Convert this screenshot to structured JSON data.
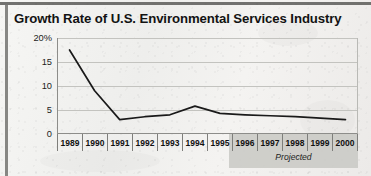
{
  "title": "Growth Rate of U.S. Environmental Services Industry",
  "annotation": "Projected",
  "colors": {
    "line": "#1a1a1a",
    "grid": "#c3c3bf",
    "axis": "#8d8d8a",
    "projected_band": "#c9c9c5",
    "paper": "#f2f2f0",
    "text": "#131313"
  },
  "chart_data": {
    "type": "line",
    "title": "Growth Rate of U.S. Environmental Services Industry",
    "xlabel": "",
    "ylabel": "",
    "categories": [
      "1989",
      "1990",
      "1991",
      "1992",
      "1993",
      "1994",
      "1995",
      "1996",
      "1997",
      "1998",
      "1999",
      "2000"
    ],
    "values": [
      17.5,
      9.0,
      3.0,
      3.6,
      4.0,
      5.8,
      4.3,
      4.0,
      3.8,
      3.6,
      3.3,
      3.0
    ],
    "ylim": [
      0,
      20
    ],
    "yticks": [
      0,
      5,
      10,
      15,
      20
    ],
    "ytick_labels": [
      "0",
      "5",
      "10",
      "15",
      "20%"
    ],
    "grid": true,
    "legend": "none",
    "annotations": [
      {
        "text": "Projected",
        "from": "1996",
        "to": "2000",
        "style": "shaded-band"
      }
    ]
  },
  "y_axis": {
    "ticks": [
      {
        "label": "20%",
        "value": 20
      },
      {
        "label": "15",
        "value": 15
      },
      {
        "label": "10",
        "value": 10
      },
      {
        "label": "5",
        "value": 5
      },
      {
        "label": "0",
        "value": 0
      }
    ]
  }
}
